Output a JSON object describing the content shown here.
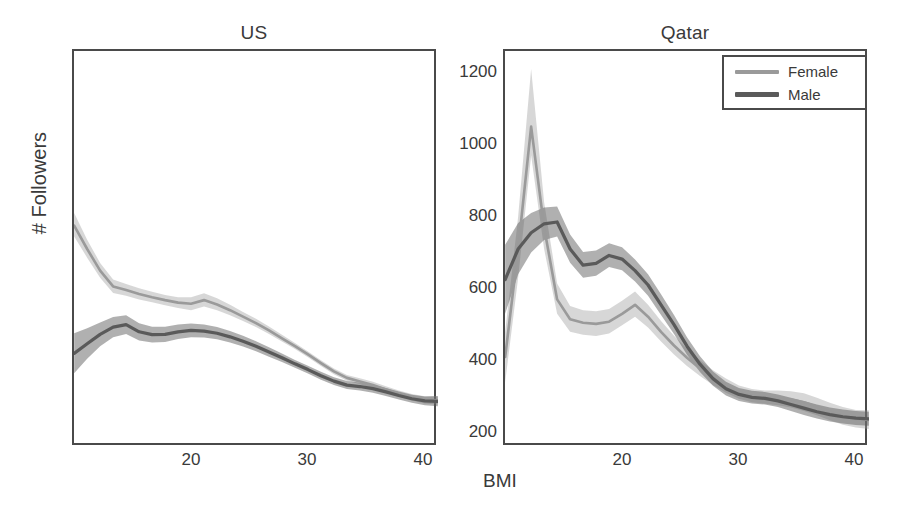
{
  "figure": {
    "xlabel": "BMI",
    "ylabel": "# Followers"
  },
  "legend": {
    "position": "top-right",
    "entries": [
      {
        "label": "Female",
        "color": "#9a9a9a"
      },
      {
        "label": "Male",
        "color": "#5a5a5a"
      }
    ]
  },
  "axis": {
    "yticks": [
      "200",
      "400",
      "600",
      "800",
      "1000",
      "1200"
    ],
    "xticks": [
      "20",
      "30",
      "40"
    ]
  },
  "chart_data": {
    "type": "line",
    "xlabel": "BMI",
    "ylabel": "# Followers",
    "xlim": [
      12,
      40
    ],
    "ylim": [
      150,
      1250
    ],
    "yticks": [
      200,
      400,
      600,
      800,
      1000,
      1200
    ],
    "xticks": [
      20,
      30,
      40
    ],
    "grid": false,
    "legend_position": "top right (outside, Qatar panel)",
    "band_meaning": "shaded confidence interval around each mean line",
    "panels": [
      {
        "name": "US",
        "title": "US",
        "x": [
          12,
          13,
          14,
          15,
          16,
          17,
          18,
          19,
          20,
          21,
          22,
          23,
          24,
          25,
          26,
          27,
          28,
          29,
          30,
          31,
          32,
          33,
          34,
          35,
          36,
          37,
          38,
          39,
          40
        ],
        "series": [
          {
            "name": "Female",
            "color": "#9a9a9a",
            "values": [
              765,
              700,
              640,
              596,
              586,
              575,
              566,
              558,
              551,
              548,
              558,
              546,
              530,
              512,
              494,
              474,
              452,
              430,
              407,
              383,
              360,
              342,
              332,
              322,
              310,
              298,
              288,
              281,
              280
            ],
            "band_lower": [
              735,
              676,
              620,
              578,
              570,
              560,
              552,
              544,
              536,
              530,
              540,
              530,
              516,
              500,
              483,
              464,
              443,
              422,
              399,
              375,
              352,
              334,
              324,
              313,
              301,
              289,
              279,
              271,
              268
            ],
            "band_upper": [
              800,
              726,
              661,
              615,
              603,
              591,
              581,
              572,
              566,
              566,
              577,
              563,
              545,
              525,
              506,
              485,
              462,
              439,
              415,
              391,
              368,
              350,
              341,
              331,
              319,
              307,
              297,
              291,
              292
            ]
          },
          {
            "name": "Male",
            "color": "#5a5a5a",
            "values": [
              410,
              437,
              463,
              483,
              490,
              470,
              462,
              463,
              470,
              474,
              472,
              466,
              456,
              444,
              430,
              414,
              398,
              381,
              365,
              348,
              333,
              322,
              318,
              312,
              303,
              293,
              284,
              278,
              277
            ],
            "band_lower": [
              355,
              395,
              430,
              455,
              464,
              446,
              440,
              442,
              450,
              455,
              454,
              449,
              440,
              429,
              416,
              401,
              386,
              370,
              354,
              337,
              322,
              311,
              307,
              301,
              292,
              282,
              273,
              266,
              263
            ],
            "band_upper": [
              466,
              480,
              496,
              511,
              516,
              494,
              484,
              484,
              490,
              493,
              490,
              483,
              472,
              459,
              444,
              427,
              410,
              392,
              376,
              359,
              344,
              333,
              329,
              323,
              314,
              304,
              295,
              290,
              291
            ]
          }
        ]
      },
      {
        "name": "Qatar",
        "title": "Qatar",
        "x": [
          12,
          13,
          14,
          15,
          16,
          17,
          18,
          19,
          20,
          21,
          22,
          23,
          24,
          25,
          26,
          27,
          28,
          29,
          30,
          31,
          32,
          33,
          34,
          35,
          36,
          37,
          38,
          39,
          40
        ],
        "series": [
          {
            "name": "Female",
            "color": "#9a9a9a",
            "values": [
              400,
              700,
              1040,
              760,
              560,
              505,
              495,
              492,
              498,
              520,
              545,
              512,
              470,
              432,
              398,
              368,
              342,
              320,
              302,
              292,
              288,
              286,
              282,
              274,
              262,
              248,
              236,
              228,
              225
            ],
            "band_lower": [
              330,
              620,
              960,
              700,
              520,
              470,
              462,
              458,
              465,
              488,
              512,
              482,
              443,
              407,
              375,
              347,
              322,
              301,
              284,
              274,
              270,
              266,
              260,
              250,
              238,
              224,
              212,
              204,
              200
            ],
            "band_upper": [
              470,
              790,
              1200,
              830,
              604,
              542,
              530,
              527,
              533,
              556,
              582,
              545,
              500,
              459,
              423,
              391,
              363,
              340,
              321,
              311,
              307,
              307,
              305,
              299,
              287,
              273,
              261,
              253,
              252
            ]
          },
          {
            "name": "Male",
            "color": "#5a5a5a",
            "values": [
              615,
              700,
              745,
              770,
              775,
              700,
              655,
              660,
              682,
              672,
              640,
              600,
              545,
              490,
              430,
              380,
              340,
              312,
              296,
              288,
              285,
              278,
              268,
              258,
              248,
              240,
              234,
              230,
              228
            ],
            "band_lower": [
              520,
              630,
              690,
              725,
              735,
              662,
              620,
              626,
              650,
              641,
              610,
              570,
              517,
              464,
              406,
              358,
              320,
              293,
              278,
              271,
              268,
              261,
              250,
              239,
              229,
              221,
              215,
              211,
              209
            ],
            "band_upper": [
              712,
              772,
              800,
              815,
              818,
              740,
              692,
              696,
              716,
              705,
              671,
              630,
              574,
              517,
              455,
              402,
              360,
              331,
              314,
              306,
              303,
              296,
              287,
              278,
              268,
              260,
              254,
              250,
              248
            ]
          }
        ]
      }
    ]
  }
}
